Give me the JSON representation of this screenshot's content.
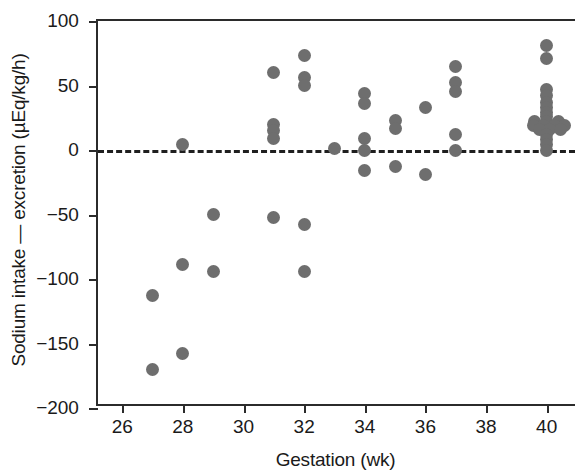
{
  "chart_data": {
    "type": "scatter",
    "title": "",
    "xlabel": "Gestation (wk)",
    "ylabel": "Sodium intake — excretion (µEq/kg/h)",
    "xlim": [
      25.2,
      41.0
    ],
    "ylim": [
      -200,
      100
    ],
    "xticks": [
      26,
      28,
      30,
      32,
      34,
      36,
      38,
      40
    ],
    "xtick_labels": [
      "26",
      "28",
      "30",
      "32",
      "34",
      "36",
      "38",
      "40"
    ],
    "yticks": [
      100,
      50,
      0,
      -50,
      -100,
      -150,
      -200
    ],
    "ytick_labels": [
      "100",
      "50",
      "0",
      "−50",
      "−100",
      "−150",
      "−200"
    ],
    "grid": false,
    "legend": null,
    "marker_color": "#6e6e6e",
    "marker_shape": "circle",
    "axis_color": "#2b2b2b",
    "reference_lines": [
      {
        "orientation": "horizontal",
        "value": 0,
        "style": "dashed",
        "color": "#1f1f1f"
      }
    ],
    "points": [
      {
        "x": 27,
        "y": -113
      },
      {
        "x": 27,
        "y": -170
      },
      {
        "x": 28,
        "y": 4
      },
      {
        "x": 28,
        "y": -89
      },
      {
        "x": 28,
        "y": -158
      },
      {
        "x": 29,
        "y": -50
      },
      {
        "x": 29,
        "y": -94
      },
      {
        "x": 31,
        "y": 60
      },
      {
        "x": 31,
        "y": 20
      },
      {
        "x": 31,
        "y": 15
      },
      {
        "x": 31,
        "y": 9
      },
      {
        "x": 31,
        "y": -52
      },
      {
        "x": 32,
        "y": 73
      },
      {
        "x": 32,
        "y": 56
      },
      {
        "x": 32,
        "y": 50
      },
      {
        "x": 32,
        "y": -58
      },
      {
        "x": 32,
        "y": -94
      },
      {
        "x": 33,
        "y": 1
      },
      {
        "x": 34,
        "y": 44
      },
      {
        "x": 34,
        "y": 36
      },
      {
        "x": 34,
        "y": 9
      },
      {
        "x": 34,
        "y": 0
      },
      {
        "x": 34,
        "y": -16
      },
      {
        "x": 35,
        "y": 23
      },
      {
        "x": 35,
        "y": 17
      },
      {
        "x": 35,
        "y": -13
      },
      {
        "x": 36,
        "y": 33
      },
      {
        "x": 36,
        "y": -19
      },
      {
        "x": 37,
        "y": 65
      },
      {
        "x": 37,
        "y": 52
      },
      {
        "x": 37,
        "y": 45
      },
      {
        "x": 37,
        "y": 12
      },
      {
        "x": 37,
        "y": 0
      },
      {
        "x": 40,
        "y": 81
      },
      {
        "x": 40,
        "y": 71
      },
      {
        "x": 40,
        "y": 47
      },
      {
        "x": 40,
        "y": 42
      },
      {
        "x": 40,
        "y": 37
      },
      {
        "x": 40,
        "y": 33
      },
      {
        "x": 40,
        "y": 29
      },
      {
        "x": 40,
        "y": 26
      },
      {
        "x": 39.6,
        "y": 22
      },
      {
        "x": 40,
        "y": 22
      },
      {
        "x": 40.4,
        "y": 22
      },
      {
        "x": 39.55,
        "y": 19
      },
      {
        "x": 39.9,
        "y": 19
      },
      {
        "x": 40.25,
        "y": 19
      },
      {
        "x": 40.6,
        "y": 19
      },
      {
        "x": 39.75,
        "y": 16
      },
      {
        "x": 40.1,
        "y": 16
      },
      {
        "x": 40.45,
        "y": 16
      },
      {
        "x": 40,
        "y": 12
      },
      {
        "x": 40,
        "y": 8
      },
      {
        "x": 40,
        "y": 4
      },
      {
        "x": 40,
        "y": 0
      }
    ]
  }
}
